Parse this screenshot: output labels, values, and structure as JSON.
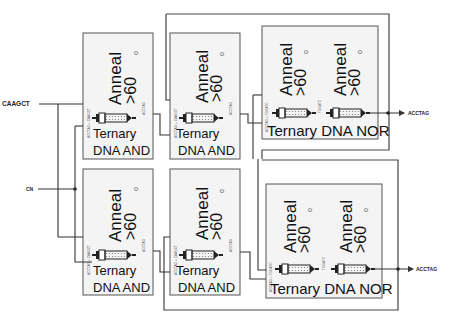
{
  "inputs": [
    {
      "id": "in1",
      "label": "CAAGCT"
    },
    {
      "id": "in2",
      "label": "CN"
    }
  ],
  "outputs": [
    {
      "id": "out1",
      "label": "ACCTAG"
    },
    {
      "id": "out2",
      "label": "ACCTAG"
    }
  ],
  "and_gates": [
    {
      "id": "and1",
      "anneal": "Anneal",
      "temp": ">60",
      "degree": "o",
      "type_line1": "Ternary",
      "type_line2": "DNA AND",
      "in_strand": "ACCTAG + CAAGCT",
      "out_strand": "ACCTAG"
    },
    {
      "id": "and2",
      "anneal": "Anneal",
      "temp": ">60",
      "degree": "o",
      "type_line1": "Ternary",
      "type_line2": "DNA AND",
      "in_strand": "ACCTAG + CAAGCT",
      "out_strand": "ACCTAG"
    },
    {
      "id": "and3",
      "anneal": "Anneal",
      "temp": ">60",
      "degree": "o",
      "type_line1": "Ternary",
      "type_line2": "DNA AND",
      "in_strand": "ACCTAG + CAAGCT",
      "out_strand": "ACCTAG"
    },
    {
      "id": "and4",
      "anneal": "Anneal",
      "temp": ">60",
      "degree": "o",
      "type_line1": "Ternary",
      "type_line2": "DNA AND",
      "in_strand": "ACCTAG + CAAGCT",
      "out_strand": "ACCTAG"
    }
  ],
  "nor_gates": [
    {
      "id": "nor1",
      "anneal": "Anneal",
      "temp": ">60",
      "degree": "o",
      "label": "Ternary DNA NOR",
      "in_strand": "ACCTAG + TGGATC",
      "mid_strand": "TGGATC"
    },
    {
      "id": "nor2",
      "anneal": "Anneal",
      "temp": ">60",
      "degree": "o",
      "label": "Ternary DNA NOR",
      "in_strand": "ACCTAG + TGGATC",
      "mid_strand": "TGGATC"
    }
  ],
  "colors": {
    "line": "#333333",
    "box_fill": "#f4f4f4",
    "background": "#ffffff"
  }
}
